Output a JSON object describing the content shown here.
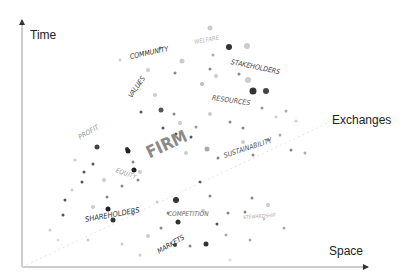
{
  "axes": {
    "y_label": "Time",
    "x_label": "Space",
    "diagonal_label": "Exchanges",
    "line_color": "#9a9a9a"
  },
  "center": {
    "label": "FIRM",
    "color": "#8a8a8a"
  },
  "words": [
    {
      "text": "COMMUNITY",
      "x": 130,
      "y": 60,
      "rot": -12,
      "size": 7,
      "color": "#333333"
    },
    {
      "text": "WELFARE",
      "x": 194,
      "y": 44,
      "rot": -10,
      "size": 6,
      "color": "#b5b5b5"
    },
    {
      "text": "STAKEHOLDERS",
      "x": 231,
      "y": 65,
      "rot": 12,
      "size": 7,
      "color": "#444444"
    },
    {
      "text": "VALUES",
      "x": 130,
      "y": 100,
      "rot": -55,
      "size": 7,
      "color": "#444444"
    },
    {
      "text": "RESOURCES",
      "x": 212,
      "y": 101,
      "rot": 8,
      "size": 7,
      "color": "#555555"
    },
    {
      "text": "PROFIT",
      "x": 79,
      "y": 141,
      "rot": -30,
      "size": 7,
      "color": "#999999"
    },
    {
      "text": "FIRM",
      "x": 147,
      "y": 160,
      "rot": -25,
      "size": 17,
      "color": "#8a8a8a"
    },
    {
      "text": "SUSTAINABILITY",
      "x": 224,
      "y": 159,
      "rot": -18,
      "size": 7,
      "color": "#555555"
    },
    {
      "text": "EQUITY",
      "x": 116,
      "y": 172,
      "rot": 20,
      "size": 6.5,
      "color": "#999999"
    },
    {
      "text": "SHAREHOLDERS",
      "x": 85,
      "y": 222,
      "rot": -10,
      "size": 7.5,
      "color": "#333333"
    },
    {
      "text": "COMPETITION",
      "x": 168,
      "y": 216,
      "rot": 0,
      "size": 6.5,
      "color": "#666666"
    },
    {
      "text": "STEWARDSHIP",
      "x": 243,
      "y": 219,
      "rot": -4,
      "size": 5,
      "color": "#aaaaaa"
    },
    {
      "text": "MARKETS",
      "x": 158,
      "y": 255,
      "rot": -30,
      "size": 7,
      "color": "#333333"
    }
  ],
  "dots": [
    [
      229,
      47,
      3,
      "#333"
    ],
    [
      253,
      91,
      3.5,
      "#333"
    ],
    [
      266,
      91,
      3,
      "#444"
    ],
    [
      210,
      28,
      2.5,
      "#ccc"
    ],
    [
      247,
      46,
      3,
      "#ccc"
    ],
    [
      160,
      48,
      1.5,
      "#888"
    ],
    [
      182,
      61,
      2.5,
      "#ccc"
    ],
    [
      213,
      55,
      1.5,
      "#aaa"
    ],
    [
      239,
      74,
      1.5,
      "#888"
    ],
    [
      248,
      80,
      3,
      "#ccc"
    ],
    [
      210,
      69,
      1.5,
      "#888"
    ],
    [
      148,
      70,
      2,
      "#ccc"
    ],
    [
      175,
      73,
      1.5,
      "#888"
    ],
    [
      216,
      76,
      2,
      "#ccc"
    ],
    [
      202,
      84,
      2,
      "#bbb"
    ],
    [
      161,
      110,
      2.5,
      "#555"
    ],
    [
      155,
      95,
      2,
      "#ccc"
    ],
    [
      174,
      114,
      1.5,
      "#888"
    ],
    [
      163,
      128,
      1.5,
      "#555"
    ],
    [
      176,
      134,
      1.5,
      "#555"
    ],
    [
      141,
      112,
      1.5,
      "#555"
    ],
    [
      191,
      137,
      1.5,
      "#555"
    ],
    [
      180,
      123,
      2,
      "#ccc"
    ],
    [
      196,
      127,
      1.5,
      "#999"
    ],
    [
      210,
      114,
      2,
      "#ccc"
    ],
    [
      207,
      149,
      2.5,
      "#aaa"
    ],
    [
      186,
      153,
      2,
      "#ccc"
    ],
    [
      218,
      158,
      1.5,
      "#888"
    ],
    [
      230,
      122,
      1.5,
      "#888"
    ],
    [
      243,
      128,
      1.5,
      "#888"
    ],
    [
      97,
      147,
      2.5,
      "#444"
    ],
    [
      93,
      164,
      1.5,
      "#555"
    ],
    [
      84,
      172,
      1.5,
      "#555"
    ],
    [
      127,
      149,
      2,
      "#333"
    ],
    [
      133,
      162,
      1.5,
      "#888"
    ],
    [
      128,
      151,
      2.5,
      "#222"
    ],
    [
      134,
      170,
      2.5,
      "#222"
    ],
    [
      140,
      172,
      2,
      "#ccc"
    ],
    [
      104,
      180,
      2,
      "#ccc"
    ],
    [
      82,
      182,
      1.5,
      "#555"
    ],
    [
      107,
      197,
      1.5,
      "#888"
    ],
    [
      122,
      186,
      1.5,
      "#888"
    ],
    [
      138,
      180,
      1.5,
      "#888"
    ],
    [
      65,
      200,
      1.5,
      "#555"
    ],
    [
      63,
      215,
      1.5,
      "#555"
    ],
    [
      108,
      209,
      2.5,
      "#222"
    ],
    [
      113,
      220,
      2.5,
      "#333"
    ],
    [
      93,
      207,
      2,
      "#ccc"
    ],
    [
      133,
      214,
      1.5,
      "#888"
    ],
    [
      157,
      202,
      1.5,
      "#ccc"
    ],
    [
      176,
      200,
      3,
      "#333"
    ],
    [
      178,
      222,
      2.5,
      "#333"
    ],
    [
      168,
      213,
      1.5,
      "#888"
    ],
    [
      210,
      196,
      1.5,
      "#888"
    ],
    [
      200,
      182,
      1.5,
      "#555"
    ],
    [
      217,
      224,
      1.5,
      "#555"
    ],
    [
      228,
      213,
      1.5,
      "#888"
    ],
    [
      245,
      212,
      1.5,
      "#888"
    ],
    [
      252,
      198,
      1.5,
      "#888"
    ],
    [
      268,
      205,
      2,
      "#ccc"
    ],
    [
      175,
      245,
      2,
      "#444"
    ],
    [
      206,
      244,
      2.5,
      "#333"
    ],
    [
      190,
      246,
      1.5,
      "#888"
    ],
    [
      148,
      236,
      2,
      "#ccc"
    ],
    [
      161,
      228,
      1.5,
      "#888"
    ],
    [
      203,
      211,
      2,
      "#ccc"
    ],
    [
      226,
      235,
      1.5,
      "#aaa"
    ],
    [
      250,
      240,
      1.5,
      "#aaa"
    ],
    [
      264,
      219,
      1.5,
      "#ccc"
    ],
    [
      284,
      228,
      1.5,
      "#aaa"
    ],
    [
      253,
      155,
      1.5,
      "#888"
    ],
    [
      268,
      140,
      1.5,
      "#888"
    ],
    [
      280,
      135,
      1.5,
      "#aaa"
    ],
    [
      291,
      150,
      1.5,
      "#888"
    ],
    [
      305,
      153,
      1.5,
      "#aaa"
    ],
    [
      262,
      108,
      1.5,
      "#999"
    ],
    [
      276,
      117,
      1.5,
      "#ccc"
    ],
    [
      286,
      111,
      1.5,
      "#aaa"
    ],
    [
      296,
      121,
      1.5,
      "#ccc"
    ],
    [
      243,
      142,
      2,
      "#ccc"
    ],
    [
      75,
      160,
      1.5,
      "#ccc"
    ],
    [
      72,
      190,
      1.5,
      "#ccc"
    ],
    [
      50,
      230,
      1.5,
      "#ccc"
    ],
    [
      58,
      240,
      1.5,
      "#ddd"
    ],
    [
      88,
      240,
      1.5,
      "#ccc"
    ],
    [
      122,
      244,
      1.5,
      "#ccc"
    ],
    [
      140,
      255,
      1.5,
      "#ccc"
    ],
    [
      230,
      260,
      1.5,
      "#ddd"
    ],
    [
      120,
      60,
      1.5,
      "#ccc"
    ],
    [
      140,
      84,
      1.5,
      "#bbb"
    ]
  ]
}
